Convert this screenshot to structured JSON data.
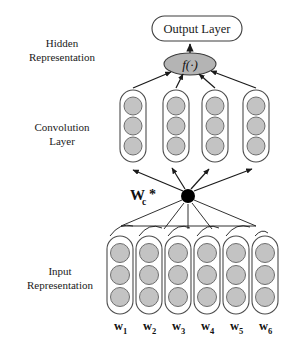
{
  "figure": {
    "background_color": "#ffffff",
    "width": 285,
    "height": 349
  },
  "colors": {
    "node_fill": "#c3c3c3",
    "node_stroke": "#6e6e6e",
    "capsule_stroke": "#4d4d4d",
    "capsule_fill": "#ffffff",
    "line": "#1a1a1a",
    "black_node": "#000000",
    "text": "#1a1a1a",
    "activation_fill": "#b4b4b4"
  },
  "side_labels": {
    "hidden_line1": "Hidden",
    "hidden_line2": "Representation",
    "conv_line1": "Convolution",
    "conv_line2": "Layer",
    "input_line1": "Input",
    "input_line2": "Representation"
  },
  "output_layer": {
    "label": "Output Layer",
    "shape": "rounded-rectangle",
    "x": 152,
    "y": 16,
    "width": 90,
    "height": 25
  },
  "activation": {
    "label": "f(·)",
    "function_letter": "f",
    "argument": "(·)",
    "shape": "ellipse",
    "cx": 190,
    "cy": 64,
    "rx": 26,
    "ry": 11
  },
  "convolution_layer": {
    "column_count": 4,
    "nodes_per_column": 3,
    "columns": [
      {
        "index": 1,
        "x": 120
      },
      {
        "index": 2,
        "x": 163
      },
      {
        "index": 3,
        "x": 202
      },
      {
        "index": 4,
        "x": 243
      }
    ],
    "capsule": {
      "width": 26,
      "height": 72,
      "top": 90,
      "radius": 13
    },
    "node_radius": 9
  },
  "conv_operator": {
    "label_main": "W",
    "label_sub": "c",
    "label_star": "*",
    "full_label": "Wᴄ*",
    "node_x": 188,
    "node_y": 196,
    "node_radius": 7,
    "fan_out_arrow_count": 4,
    "fan_in_line_count": 6
  },
  "input_layer": {
    "column_count": 6,
    "nodes_per_column": 3,
    "word_labels": [
      "w₁",
      "w₂",
      "w₃",
      "w₄",
      "w₅",
      "w₆"
    ],
    "word_base": "w",
    "word_subscripts": [
      "1",
      "2",
      "3",
      "4",
      "5",
      "6"
    ],
    "columns": [
      {
        "index": 1,
        "x": 107
      },
      {
        "index": 2,
        "x": 136
      },
      {
        "index": 3,
        "x": 165
      },
      {
        "index": 4,
        "x": 194
      },
      {
        "index": 5,
        "x": 223
      },
      {
        "index": 6,
        "x": 252
      }
    ],
    "capsule": {
      "width": 26,
      "height": 78,
      "top": 236,
      "radius": 13
    },
    "node_radius": 9,
    "label_y": 327
  },
  "connections": {
    "activation_to_output": "arrow-up",
    "conv_to_activation": "4 arrows converging upward",
    "operator_to_conv": "4 arrows fanning upward",
    "input_to_operator": "6 lines converging upward",
    "input_arcs": "5 arcs linking adjacent input columns"
  }
}
